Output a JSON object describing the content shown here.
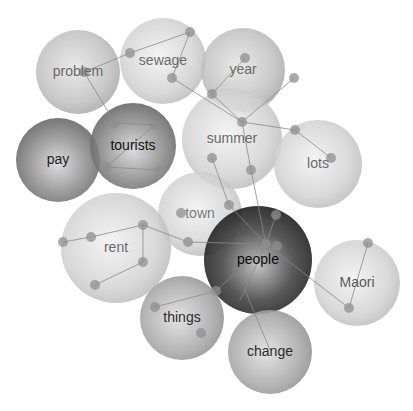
{
  "diagram": {
    "type": "bubble-concept-map",
    "nodes": [
      {
        "id": "problem",
        "label": "problem",
        "cx": 78,
        "cy": 72,
        "r": 42,
        "shade": "light",
        "text": "#6a6a6a"
      },
      {
        "id": "sewage",
        "label": "sewage",
        "cx": 163,
        "cy": 61,
        "r": 43,
        "shade": "lighter",
        "text": "#6a6a6a"
      },
      {
        "id": "year",
        "label": "year",
        "cx": 243,
        "cy": 70,
        "r": 42,
        "shade": "light",
        "text": "#6a6a6a"
      },
      {
        "id": "pay",
        "label": "pay",
        "cx": 58,
        "cy": 160,
        "r": 42,
        "shade": "dark",
        "text": "#1e1e1e"
      },
      {
        "id": "tourists",
        "label": "tourists",
        "cx": 133,
        "cy": 146,
        "r": 43,
        "shade": "dark",
        "text": "#111111"
      },
      {
        "id": "summer",
        "label": "summer",
        "cx": 232,
        "cy": 139,
        "r": 50,
        "shade": "lighter",
        "text": "#6a6a6a"
      },
      {
        "id": "lots",
        "label": "lots",
        "cx": 318,
        "cy": 164,
        "r": 44,
        "shade": "lighter",
        "text": "#6a6a6a"
      },
      {
        "id": "town",
        "label": "town",
        "cx": 200,
        "cy": 214,
        "r": 42,
        "shade": "lighter",
        "text": "#7a7a7a"
      },
      {
        "id": "rent",
        "label": "rent",
        "cx": 116,
        "cy": 248,
        "r": 55,
        "shade": "lighter",
        "text": "#6a6a6a"
      },
      {
        "id": "people",
        "label": "people",
        "cx": 258,
        "cy": 260,
        "r": 54,
        "shade": "darkest",
        "text": "#0a0a0a"
      },
      {
        "id": "maori",
        "label": "Maori",
        "cx": 357,
        "cy": 283,
        "r": 43,
        "shade": "lighter",
        "text": "#5a5a5a"
      },
      {
        "id": "things",
        "label": "things",
        "cx": 182,
        "cy": 318,
        "r": 42,
        "shade": "medium",
        "text": "#2a2a2a"
      },
      {
        "id": "change",
        "label": "change",
        "cx": 270,
        "cy": 352,
        "r": 42,
        "shade": "medium",
        "text": "#2a2a2a"
      }
    ],
    "points": [
      [
        130,
        53
      ],
      [
        190,
        32
      ],
      [
        172,
        78
      ],
      [
        84,
        72
      ],
      [
        115,
        123
      ],
      [
        155,
        125
      ],
      [
        106,
        167
      ],
      [
        160,
        170
      ],
      [
        245,
        58
      ],
      [
        294,
        78
      ],
      [
        212,
        94
      ],
      [
        242,
        122
      ],
      [
        212,
        158
      ],
      [
        251,
        170
      ],
      [
        295,
        130
      ],
      [
        331,
        158
      ],
      [
        188,
        242
      ],
      [
        229,
        205
      ],
      [
        181,
        213
      ],
      [
        143,
        225
      ],
      [
        91,
        237
      ],
      [
        63,
        242
      ],
      [
        95,
        285
      ],
      [
        143,
        262
      ],
      [
        266,
        244
      ],
      [
        277,
        246
      ],
      [
        368,
        243
      ],
      [
        349,
        308
      ],
      [
        155,
        307
      ],
      [
        201,
        333
      ],
      [
        216,
        291
      ],
      [
        276,
        215
      ]
    ],
    "edges": [
      [
        [
          84,
          72
        ],
        [
          130,
          53
        ]
      ],
      [
        [
          130,
          53
        ],
        [
          190,
          32
        ]
      ],
      [
        [
          190,
          32
        ],
        [
          172,
          78
        ]
      ],
      [
        [
          172,
          78
        ],
        [
          242,
          122
        ]
      ],
      [
        [
          84,
          72
        ],
        [
          115,
          123
        ]
      ],
      [
        [
          115,
          123
        ],
        [
          155,
          125
        ]
      ],
      [
        [
          106,
          167
        ],
        [
          160,
          170
        ]
      ],
      [
        [
          155,
          125
        ],
        [
          106,
          167
        ]
      ],
      [
        [
          245,
          58
        ],
        [
          212,
          94
        ]
      ],
      [
        [
          212,
          94
        ],
        [
          242,
          122
        ]
      ],
      [
        [
          294,
          78
        ],
        [
          242,
          122
        ]
      ],
      [
        [
          242,
          122
        ],
        [
          295,
          130
        ]
      ],
      [
        [
          295,
          130
        ],
        [
          331,
          158
        ]
      ],
      [
        [
          242,
          122
        ],
        [
          251,
          170
        ]
      ],
      [
        [
          251,
          170
        ],
        [
          266,
          244
        ]
      ],
      [
        [
          212,
          158
        ],
        [
          229,
          205
        ]
      ],
      [
        [
          229,
          205
        ],
        [
          266,
          244
        ]
      ],
      [
        [
          188,
          242
        ],
        [
          266,
          244
        ]
      ],
      [
        [
          143,
          225
        ],
        [
          188,
          242
        ]
      ],
      [
        [
          63,
          242
        ],
        [
          91,
          237
        ]
      ],
      [
        [
          91,
          237
        ],
        [
          143,
          225
        ]
      ],
      [
        [
          143,
          225
        ],
        [
          143,
          262
        ]
      ],
      [
        [
          143,
          262
        ],
        [
          95,
          285
        ]
      ],
      [
        [
          266,
          244
        ],
        [
          349,
          308
        ]
      ],
      [
        [
          349,
          308
        ],
        [
          368,
          243
        ]
      ],
      [
        [
          155,
          307
        ],
        [
          216,
          291
        ]
      ],
      [
        [
          216,
          291
        ],
        [
          266,
          244
        ]
      ],
      [
        [
          266,
          244
        ],
        [
          276,
          215
        ]
      ],
      [
        [
          245,
          290
        ],
        [
          270,
          350
        ]
      ],
      [
        [
          266,
          244
        ],
        [
          240,
          300
        ]
      ]
    ]
  }
}
